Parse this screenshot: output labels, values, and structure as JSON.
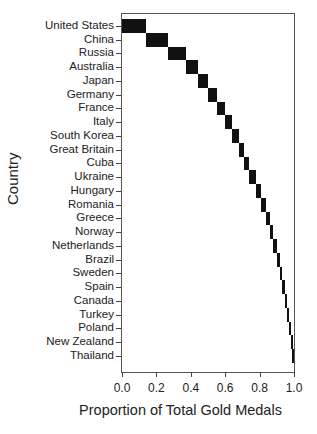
{
  "chart_data": {
    "type": "bar",
    "subtype": "cumulative-step (waterfall) horizontal",
    "title": "",
    "xlabel": "Proportion of Total Gold Medals",
    "ylabel": "Country",
    "xlim": [
      0.0,
      1.0
    ],
    "x_ticks": [
      "0.0",
      "0.2",
      "0.4",
      "0.6",
      "0.8",
      "1.0"
    ],
    "grid": false,
    "legend": null,
    "categories": [
      "United States",
      "China",
      "Russia",
      "Australia",
      "Japan",
      "Germany",
      "France",
      "Italy",
      "South Korea",
      "Great Britain",
      "Cuba",
      "Ukraine",
      "Hungary",
      "Romania",
      "Greece",
      "Norway",
      "Netherlands",
      "Brazil",
      "Sweden",
      "Spain",
      "Canada",
      "Turkey",
      "Poland",
      "New Zealand",
      "Thailand"
    ],
    "start": [
      0.0,
      0.14,
      0.27,
      0.37,
      0.44,
      0.5,
      0.55,
      0.6,
      0.64,
      0.68,
      0.71,
      0.74,
      0.78,
      0.81,
      0.84,
      0.86,
      0.88,
      0.9,
      0.92,
      0.93,
      0.95,
      0.96,
      0.97,
      0.98,
      0.99
    ],
    "end": [
      0.14,
      0.27,
      0.37,
      0.44,
      0.5,
      0.55,
      0.6,
      0.64,
      0.68,
      0.71,
      0.74,
      0.78,
      0.81,
      0.84,
      0.86,
      0.88,
      0.9,
      0.92,
      0.93,
      0.95,
      0.96,
      0.97,
      0.98,
      0.99,
      1.0
    ],
    "values": [
      0.14,
      0.13,
      0.1,
      0.07,
      0.06,
      0.05,
      0.05,
      0.04,
      0.04,
      0.03,
      0.03,
      0.04,
      0.03,
      0.03,
      0.02,
      0.02,
      0.02,
      0.02,
      0.01,
      0.02,
      0.01,
      0.01,
      0.01,
      0.01,
      0.01
    ],
    "bar_color": "#111111"
  }
}
